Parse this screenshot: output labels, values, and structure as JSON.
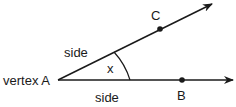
{
  "diagram": {
    "title": "",
    "labels": {
      "vertex": "vertex A",
      "upper_side": "side",
      "lower_side": "side",
      "angle": "x",
      "point_c": "C",
      "point_b": "B"
    },
    "colors": {
      "stroke": "#1a1a1a",
      "background": "#ffffff"
    }
  }
}
